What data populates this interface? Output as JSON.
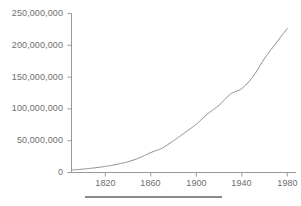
{
  "figure": {
    "background_color": "#ffffff",
    "line_color": "#8a8a8a",
    "axis_color": "#9a9a9a",
    "text_color": "#6e6e6e",
    "caption_rule": ""
  },
  "axes": {
    "y_ticks": [
      {
        "label": "250,000,000",
        "value": 250000000
      },
      {
        "label": "200,000,000",
        "value": 200000000
      },
      {
        "label": "150,000,000",
        "value": 150000000
      },
      {
        "label": "100,000,000",
        "value": 100000000
      },
      {
        "label": "50,000,000",
        "value": 50000000
      },
      {
        "label": "0",
        "value": 0
      }
    ],
    "x_ticks": [
      {
        "label": "1820",
        "value": 1820
      },
      {
        "label": "1860",
        "value": 1860
      },
      {
        "label": "1900",
        "value": 1900
      },
      {
        "label": "1940",
        "value": 1940
      },
      {
        "label": "1980",
        "value": 1980
      }
    ]
  },
  "chart_data": {
    "type": "line",
    "title": "",
    "xlabel": "",
    "ylabel": "",
    "xlim": [
      1790,
      1980
    ],
    "ylim": [
      0,
      250000000
    ],
    "grid": false,
    "legend": false,
    "x": [
      1790,
      1800,
      1810,
      1820,
      1830,
      1840,
      1850,
      1860,
      1870,
      1880,
      1890,
      1900,
      1910,
      1920,
      1930,
      1940,
      1950,
      1960,
      1970,
      1980
    ],
    "series": [
      {
        "name": "Population",
        "values": [
          3929214,
          5308483,
          7239881,
          9638453,
          12866020,
          17069453,
          23191876,
          31443321,
          38558371,
          50189209,
          62979766,
          76212168,
          92228496,
          106021537,
          123202624,
          132164569,
          151325798,
          179323175,
          203211926,
          226545805
        ]
      }
    ]
  }
}
